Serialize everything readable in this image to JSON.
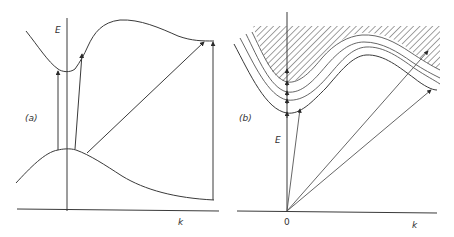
{
  "panels": [
    {
      "id": "a",
      "label": "(a)",
      "y_axis_label": "E",
      "x_axis_label": "k",
      "curves": [
        "conduction-band",
        "valence-band"
      ],
      "transitions": [
        "vertical-direct",
        "near-vertical",
        "oblique-indirect",
        "vertical-at-zone-edge"
      ]
    },
    {
      "id": "b",
      "label": "(b)",
      "y_axis_label": "E",
      "x_axis_label": "k",
      "origin_label": "0",
      "curves": [
        "band-1",
        "band-2",
        "band-3",
        "band-4",
        "continuum-hatched"
      ],
      "transitions": [
        "from-origin-to-band-1-min",
        "from-origin-to-band-3",
        "from-origin-to-band-1-edge"
      ]
    }
  ],
  "colors": {
    "line": "#3a3a3a",
    "background": "#ffffff"
  }
}
